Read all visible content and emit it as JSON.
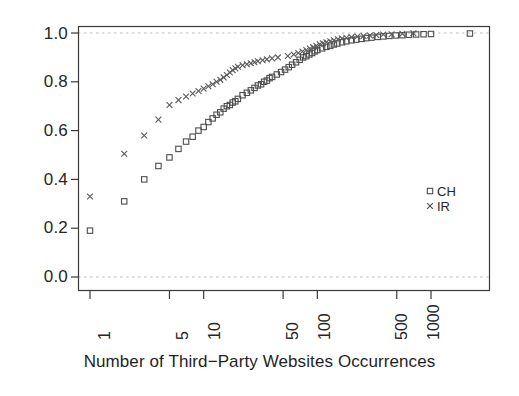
{
  "chart_data": {
    "type": "scatter",
    "title": "",
    "subtitle": "",
    "xlabel": "Number of Third−Party Websites Occurrences",
    "ylabel": "",
    "xscale": "log",
    "yscale": "linear",
    "xlim": [
      0.85,
      3000
    ],
    "ylim": [
      0.0,
      1.0
    ],
    "xticks": [
      1,
      5,
      10,
      50,
      100,
      500,
      1000
    ],
    "xticklabels": [
      "1",
      "5",
      "10",
      "50",
      "100",
      "500",
      "1000"
    ],
    "yticks": [
      0.0,
      0.2,
      0.4,
      0.6,
      0.8,
      1.0
    ],
    "yticklabels": [
      "0.0",
      "0.2",
      "0.4",
      "0.6",
      "0.8",
      "1.0"
    ],
    "grid": false,
    "reference_lines": [
      {
        "name": "upper-reference-line",
        "y": 1.0,
        "style": "dashed",
        "color": "#bdbdbd"
      },
      {
        "name": "lower-reference-line",
        "y": 0.0,
        "style": "dashed",
        "color": "#bdbdbd"
      }
    ],
    "legend": {
      "position": "right-middle",
      "entries": [
        {
          "label": "CH",
          "marker": "square",
          "color": "#4d4d4d"
        },
        {
          "label": "IR",
          "marker": "cross",
          "color": "#4d4d4d"
        }
      ]
    },
    "series": [
      {
        "name": "CH",
        "marker": "square",
        "color": "#4d4d4d",
        "points": [
          [
            1,
            0.19
          ],
          [
            2,
            0.31
          ],
          [
            3,
            0.4
          ],
          [
            4,
            0.455
          ],
          [
            5,
            0.49
          ],
          [
            6,
            0.525
          ],
          [
            7,
            0.555
          ],
          [
            8,
            0.575
          ],
          [
            9,
            0.6
          ],
          [
            10,
            0.615
          ],
          [
            11,
            0.635
          ],
          [
            12,
            0.65
          ],
          [
            13,
            0.665
          ],
          [
            14,
            0.675
          ],
          [
            15,
            0.69
          ],
          [
            16,
            0.7
          ],
          [
            17,
            0.705
          ],
          [
            18,
            0.715
          ],
          [
            19,
            0.72
          ],
          [
            20,
            0.73
          ],
          [
            22,
            0.745
          ],
          [
            24,
            0.755
          ],
          [
            26,
            0.765
          ],
          [
            28,
            0.775
          ],
          [
            30,
            0.785
          ],
          [
            32,
            0.79
          ],
          [
            34,
            0.8
          ],
          [
            36,
            0.805
          ],
          [
            38,
            0.815
          ],
          [
            40,
            0.82
          ],
          [
            44,
            0.83
          ],
          [
            48,
            0.84
          ],
          [
            52,
            0.85
          ],
          [
            56,
            0.86
          ],
          [
            60,
            0.87
          ],
          [
            65,
            0.88
          ],
          [
            70,
            0.89
          ],
          [
            75,
            0.9
          ],
          [
            80,
            0.905
          ],
          [
            85,
            0.912
          ],
          [
            90,
            0.918
          ],
          [
            95,
            0.925
          ],
          [
            100,
            0.93
          ],
          [
            110,
            0.937
          ],
          [
            120,
            0.943
          ],
          [
            130,
            0.948
          ],
          [
            140,
            0.953
          ],
          [
            150,
            0.957
          ],
          [
            165,
            0.962
          ],
          [
            180,
            0.966
          ],
          [
            200,
            0.97
          ],
          [
            220,
            0.973
          ],
          [
            245,
            0.976
          ],
          [
            270,
            0.979
          ],
          [
            300,
            0.981
          ],
          [
            340,
            0.984
          ],
          [
            380,
            0.986
          ],
          [
            430,
            0.988
          ],
          [
            490,
            0.99
          ],
          [
            560,
            0.991
          ],
          [
            640,
            0.993
          ],
          [
            740,
            0.994
          ],
          [
            860,
            0.995
          ],
          [
            1000,
            0.996
          ],
          [
            2200,
            0.998
          ]
        ]
      },
      {
        "name": "IR",
        "marker": "cross",
        "color": "#5a5a5a",
        "points": [
          [
            1,
            0.33
          ],
          [
            2,
            0.505
          ],
          [
            3,
            0.58
          ],
          [
            4,
            0.645
          ],
          [
            5,
            0.705
          ],
          [
            6,
            0.725
          ],
          [
            7,
            0.74
          ],
          [
            8,
            0.752
          ],
          [
            9,
            0.762
          ],
          [
            10,
            0.772
          ],
          [
            11,
            0.782
          ],
          [
            12,
            0.79
          ],
          [
            13,
            0.8
          ],
          [
            14,
            0.808
          ],
          [
            15,
            0.818
          ],
          [
            16,
            0.828
          ],
          [
            17,
            0.838
          ],
          [
            18,
            0.848
          ],
          [
            19,
            0.855
          ],
          [
            20,
            0.862
          ],
          [
            22,
            0.868
          ],
          [
            24,
            0.872
          ],
          [
            26,
            0.876
          ],
          [
            28,
            0.88
          ],
          [
            30,
            0.884
          ],
          [
            33,
            0.888
          ],
          [
            36,
            0.892
          ],
          [
            40,
            0.896
          ],
          [
            45,
            0.9
          ],
          [
            55,
            0.906
          ],
          [
            62,
            0.912
          ],
          [
            68,
            0.918
          ],
          [
            74,
            0.924
          ],
          [
            80,
            0.93
          ],
          [
            86,
            0.936
          ],
          [
            92,
            0.942
          ],
          [
            98,
            0.948
          ],
          [
            105,
            0.954
          ],
          [
            112,
            0.958
          ],
          [
            120,
            0.962
          ],
          [
            130,
            0.966
          ],
          [
            140,
            0.97
          ],
          [
            152,
            0.974
          ],
          [
            165,
            0.977
          ],
          [
            180,
            0.98
          ],
          [
            200,
            0.983
          ],
          [
            225,
            0.986
          ],
          [
            255,
            0.988
          ],
          [
            290,
            0.99
          ],
          [
            330,
            0.992
          ],
          [
            380,
            0.994
          ],
          [
            450,
            0.995
          ],
          [
            560,
            0.997
          ],
          [
            700,
            0.999
          ]
        ]
      }
    ]
  },
  "axes": {
    "y_labels": [
      "1.0",
      "0.8",
      "0.6",
      "0.4",
      "0.2",
      "0.0"
    ],
    "x_labels": [
      "1",
      "5",
      "10",
      "50",
      "100",
      "500",
      "1000"
    ],
    "x_title": "Number of Third−Party Websites Occurrences"
  },
  "legend": {
    "ch_label": "CH",
    "ir_label": "IR"
  },
  "colors": {
    "marker": "#4d4d4d",
    "axis": "#3a3a3a",
    "reference": "#c0c0c0",
    "background": "#ffffff"
  }
}
